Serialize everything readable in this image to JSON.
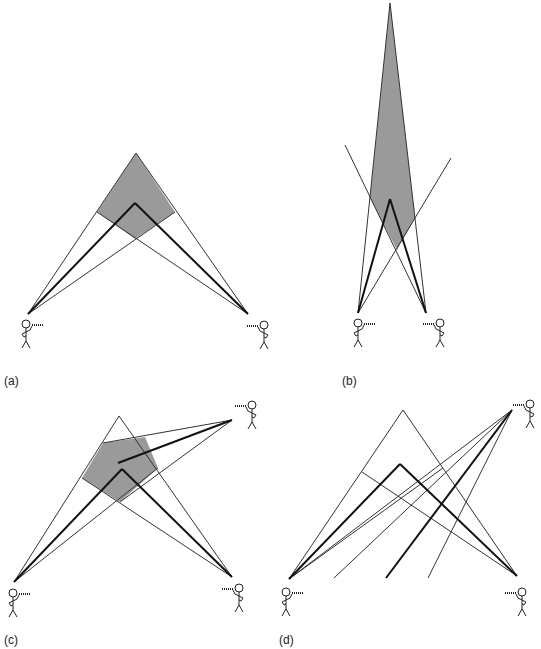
{
  "figure": {
    "panels": [
      {
        "id": "a",
        "label": "(a)"
      },
      {
        "id": "b",
        "label": "(b)"
      },
      {
        "id": "c",
        "label": "(c)"
      },
      {
        "id": "d",
        "label": "(d)"
      }
    ],
    "colors": {
      "shade": "#9a9a9a",
      "line": "#333333",
      "bold": "#111111"
    }
  }
}
